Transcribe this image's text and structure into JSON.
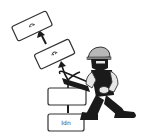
{
  "illustration": {
    "subject": "worker sawing a stack of boxes",
    "boxes": [
      {
        "id": "bottom",
        "label": "Idn",
        "icon": "none"
      },
      {
        "id": "middle",
        "label": "",
        "icon": "none"
      },
      {
        "id": "upper",
        "label": "",
        "icon": "smile-icon"
      },
      {
        "id": "top",
        "label": "",
        "icon": "smile-icon"
      }
    ],
    "arrows": [
      "up-arrow",
      "up-arrow",
      "up-arrow"
    ],
    "colors": {
      "ink": "#1a1a1a",
      "helmet": "#b8b8b8",
      "skin": "#e6e6e6",
      "outline": "#333333",
      "background": "#ffffff"
    }
  }
}
